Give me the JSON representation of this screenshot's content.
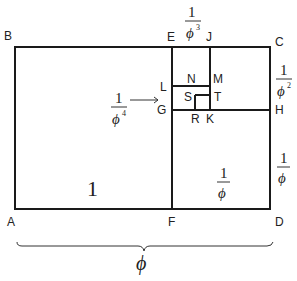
{
  "diagram": {
    "points": {
      "A": "A",
      "B": "B",
      "C": "C",
      "D": "D",
      "E": "E",
      "F": "F",
      "G": "G",
      "H": "H",
      "J": "J",
      "K": "K",
      "L": "L",
      "M": "M",
      "N": "N",
      "R": "R",
      "S": "S",
      "T": "T"
    },
    "labels": {
      "big_square": "1",
      "one": "1",
      "phi": "ϕ",
      "width_label": "ϕ",
      "exp2": "2",
      "exp3": "3",
      "exp4": "4"
    },
    "fractions": [
      {
        "id": "phi_inv",
        "numerator": "1",
        "denominator": "ϕ",
        "note": "inside square FD"
      },
      {
        "id": "phi_inv_side",
        "numerator": "1",
        "denominator": "ϕ",
        "note": "right side HD"
      },
      {
        "id": "phi_inv2",
        "numerator": "1",
        "denominator": "ϕ²",
        "note": "right side CH"
      },
      {
        "id": "phi_inv3",
        "numerator": "1",
        "denominator": "ϕ³",
        "note": "top EJ"
      },
      {
        "id": "phi_inv4",
        "numerator": "1",
        "denominator": "ϕ⁴",
        "note": "arrow to GL"
      }
    ],
    "colors": {
      "line": "#1a1a1a",
      "background": "#ffffff"
    }
  }
}
